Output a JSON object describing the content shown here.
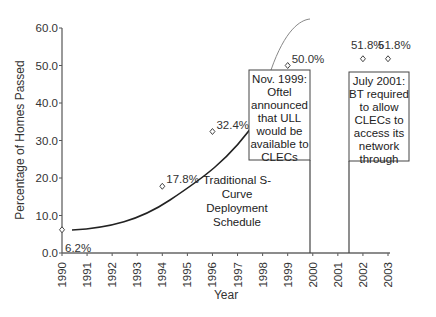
{
  "chart_data": {
    "type": "scatter",
    "title": "",
    "xlabel": "Year",
    "ylabel": "Percentage of Homes Passed",
    "ylim": [
      0,
      60
    ],
    "xlim": [
      1990,
      2003
    ],
    "y_ticks": [
      "0.0",
      "10.0",
      "20.0",
      "30.0",
      "40.0",
      "50.0",
      "60.0"
    ],
    "x_ticks": [
      "1990",
      "1991",
      "1992",
      "1993",
      "1994",
      "1995",
      "1996",
      "1997",
      "1998",
      "1999",
      "2000",
      "2001",
      "2002",
      "2003"
    ],
    "grid": false,
    "legend": null,
    "series": [
      {
        "name": "Actual homes passed",
        "marker": "diamond",
        "x": [
          1990,
          1994,
          1996,
          1999,
          2002,
          2003
        ],
        "values": [
          6.2,
          17.8,
          32.4,
          50.0,
          51.8,
          51.8
        ],
        "labels": [
          "6.2%",
          "17.8%",
          "32.4%",
          "50.0%",
          "51.8%",
          "51.8%"
        ]
      },
      {
        "name": "Traditional S-Curve Deployment Schedule",
        "type": "line",
        "x": [
          1990.5,
          1992,
          1994,
          1995,
          1996,
          1997,
          1998,
          1998.5,
          1999,
          1999.5,
          2000
        ],
        "values": [
          6.2,
          7.5,
          11.5,
          15,
          20,
          27,
          38,
          46,
          54,
          59,
          61
        ]
      }
    ],
    "annotations": [
      {
        "text": "Traditional S-Curve Deployment Schedule",
        "x": 1997,
        "y": 20
      },
      {
        "text": "Nov. 1999: Oftel announced that ULL would be available to CLECs",
        "x": 1999.9,
        "marker_line": true
      },
      {
        "text": "July 2001: BT required to allow CLECs to access its network through",
        "x": 2001.5,
        "marker_line": true
      }
    ]
  },
  "labels": {
    "ylabel": "Percentage of Homes Passed",
    "xlabel": "Year",
    "scurve": [
      "Traditional S-",
      "Curve",
      "Deployment",
      "Schedule"
    ],
    "box1": [
      "Nov. 1999:",
      "Oftel",
      "announced",
      "that ULL",
      "would be",
      "available to",
      "CLECs"
    ],
    "box2": [
      "July 2001:",
      "BT required",
      "to allow",
      "CLECs to",
      "access its",
      "network",
      "through"
    ]
  },
  "colors": {
    "axis": "#555555",
    "curve": "#222222",
    "arc": "#777777",
    "text": "#333333"
  }
}
